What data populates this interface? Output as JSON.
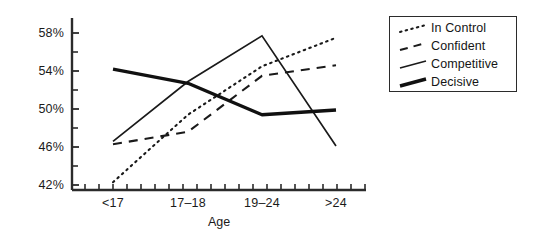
{
  "chart_data": {
    "type": "line",
    "title": "",
    "xlabel": "Age",
    "ylabel": "",
    "categories": [
      "<17",
      "17–18",
      "19–24",
      ">24"
    ],
    "ytick_labels": [
      "42%",
      "46%",
      "50%",
      "54%",
      "58%"
    ],
    "ytick_values": [
      42,
      46,
      50,
      54,
      58
    ],
    "ylim": [
      40,
      59
    ],
    "minor_ticks": true,
    "grid": false,
    "legend_position": "right",
    "series": [
      {
        "name": "In Control",
        "style": "dotted",
        "values": [
          42.3,
          49.4,
          54.5,
          57.5
        ]
      },
      {
        "name": "Confident",
        "style": "dashed",
        "values": [
          46.3,
          47.6,
          53.5,
          54.6
        ]
      },
      {
        "name": "Competitive",
        "style": "solid-thin",
        "values": [
          46.6,
          52.9,
          57.7,
          46.1
        ]
      },
      {
        "name": "Decisive",
        "style": "solid-thick",
        "values": [
          54.2,
          52.7,
          49.4,
          49.9
        ]
      }
    ]
  },
  "legend": {
    "items": [
      {
        "label": "In Control"
      },
      {
        "label": "Confident"
      },
      {
        "label": "Competitive"
      },
      {
        "label": "Decisive"
      }
    ]
  },
  "colors": {
    "ink": "#1a1a1a",
    "axis": "#2b2b2b",
    "background": "#ffffff"
  }
}
